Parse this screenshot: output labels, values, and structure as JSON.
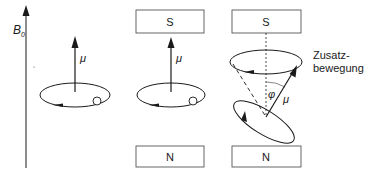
{
  "axis": {
    "label": "B",
    "subscript": "0"
  },
  "panels": [
    {
      "id": "free",
      "moment_label": "μ"
    },
    {
      "id": "magnet",
      "moment_label": "μ",
      "top_pole": "S",
      "bottom_pole": "N"
    },
    {
      "id": "precession",
      "moment_label": "μ",
      "angle_label": "φ",
      "top_pole": "S",
      "bottom_pole": "N",
      "annotation_line1": "Zusatz-",
      "annotation_line2": "bewegung"
    }
  ],
  "colors": {
    "stroke": "#1a1a1a",
    "box_fill": "#ffffff",
    "box_stroke": "#555555"
  }
}
